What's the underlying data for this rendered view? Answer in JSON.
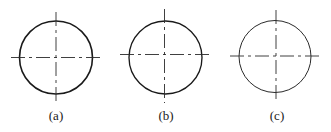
{
  "figure": {
    "panels": [
      {
        "id": "a",
        "label": "(a)",
        "circle": {
          "cx": 56,
          "cy": 57.5,
          "r": 36.5,
          "stroke_weight": "thick"
        },
        "horizontal_center_line": {
          "x1": 11,
          "x2": 101,
          "y": 57.5
        },
        "vertical_center_line": {
          "x": 56,
          "y1": 12,
          "y2": 104
        },
        "label_x": 56
      },
      {
        "id": "b",
        "label": "(b)",
        "circle": {
          "cx": 165.5,
          "cy": 57.5,
          "r": 36.5,
          "stroke_weight": "medium"
        },
        "horizontal_center_line": {
          "x1": 120,
          "x2": 211,
          "y": 54.5
        },
        "vertical_center_line": {
          "x": 164.5,
          "y1": 9,
          "y2": 103
        },
        "label_x": 166
      },
      {
        "id": "c",
        "label": "(c)",
        "circle": {
          "cx": 275,
          "cy": 56.5,
          "r": 36,
          "stroke_weight": "thin"
        },
        "horizontal_center_line": {
          "x1": 230,
          "x2": 322,
          "y": 56
        },
        "vertical_center_line": {
          "x": 276,
          "y1": 10,
          "y2": 103
        },
        "label_x": 277
      }
    ],
    "colors": {
      "background": "#ffffff",
      "stroke": "#1a1a1a"
    }
  }
}
